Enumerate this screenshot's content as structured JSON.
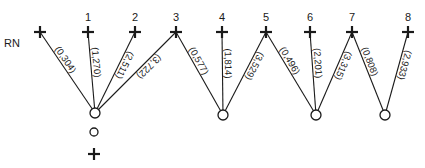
{
  "diagram": {
    "reference_label": "RN",
    "stations": [
      {
        "id": "RN",
        "label": "",
        "x": 40,
        "y": 32
      },
      {
        "id": "1",
        "label": "1",
        "x": 88,
        "y": 32
      },
      {
        "id": "2",
        "label": "2",
        "x": 135,
        "y": 32
      },
      {
        "id": "3",
        "label": "3",
        "x": 176,
        "y": 32
      },
      {
        "id": "4",
        "label": "4",
        "x": 222,
        "y": 32
      },
      {
        "id": "5",
        "label": "5",
        "x": 266,
        "y": 32
      },
      {
        "id": "6",
        "label": "6",
        "x": 310,
        "y": 32
      },
      {
        "id": "7",
        "label": "7",
        "x": 352,
        "y": 32
      },
      {
        "id": "8",
        "label": "8",
        "x": 408,
        "y": 32
      }
    ],
    "setups": [
      {
        "id": "C1",
        "x": 95,
        "y": 113
      },
      {
        "id": "C2",
        "x": 223,
        "y": 115
      },
      {
        "id": "C3",
        "x": 316,
        "y": 115
      },
      {
        "id": "C4",
        "x": 385,
        "y": 115
      }
    ],
    "edges": [
      {
        "from": "C1",
        "to": "RN",
        "label": "(0,304)"
      },
      {
        "from": "C1",
        "to": "1",
        "label": "(1,270)"
      },
      {
        "from": "C1",
        "to": "2",
        "label": "(2,511)"
      },
      {
        "from": "C1",
        "to": "3",
        "label": "(3,722)"
      },
      {
        "from": "C2",
        "to": "3",
        "label": "(0,577)"
      },
      {
        "from": "C2",
        "to": "4",
        "label": "(1,814)"
      },
      {
        "from": "C2",
        "to": "5",
        "label": "(3,529)"
      },
      {
        "from": "C3",
        "to": "5",
        "label": "(0,496)"
      },
      {
        "from": "C3",
        "to": "6",
        "label": "(2,201)"
      },
      {
        "from": "C3",
        "to": "7",
        "label": "(3,315)"
      },
      {
        "from": "C4",
        "to": "7",
        "label": "(0,808)"
      },
      {
        "from": "C4",
        "to": "8",
        "label": "(2,933)"
      }
    ],
    "legend": {
      "circle_symbol": {
        "x": 94,
        "y": 132
      },
      "cross_symbol": {
        "x": 94,
        "y": 154
      }
    },
    "colors": {
      "ink": "#1a1a1a",
      "background": "#ffffff"
    }
  }
}
